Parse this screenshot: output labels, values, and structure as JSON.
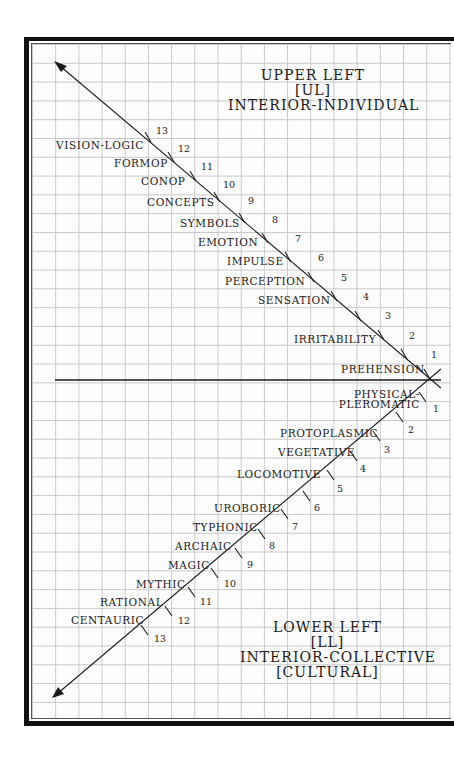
{
  "upper": {
    "title_lines": [
      "UPPER LEFT",
      "[UL]",
      "INTERIOR-INDIVIDUAL"
    ],
    "levels": [
      {
        "n": "1",
        "label": "PREHENSION"
      },
      {
        "n": "2",
        "label": ""
      },
      {
        "n": "3",
        "label": "IRRITABILITY"
      },
      {
        "n": "4",
        "label": "SENSATION"
      },
      {
        "n": "5",
        "label": "PERCEPTION"
      },
      {
        "n": "6",
        "label": "IMPULSE"
      },
      {
        "n": "7",
        "label": "EMOTION"
      },
      {
        "n": "8",
        "label": "SYMBOLS"
      },
      {
        "n": "9",
        "label": "CONCEPTS"
      },
      {
        "n": "10",
        "label": "CONOP"
      },
      {
        "n": "11",
        "label": "FORMOP"
      },
      {
        "n": "12",
        "label": "VISION-LOGIC"
      },
      {
        "n": "13",
        "label": ""
      }
    ]
  },
  "lower": {
    "title_lines": [
      "LOWER LEFT",
      "[LL]",
      "INTERIOR-COLLECTIVE",
      "[CULTURAL]"
    ],
    "levels": [
      {
        "n": "1",
        "label_lines": [
          "PHYSICAL-",
          "PLEROMATIC"
        ]
      },
      {
        "n": "2",
        "label": "PROTOPLASMIC"
      },
      {
        "n": "3",
        "label": "VEGETATIVE"
      },
      {
        "n": "4",
        "label": "LOCOMOTIVE"
      },
      {
        "n": "5",
        "label": ""
      },
      {
        "n": "6",
        "label": "UROBORIC"
      },
      {
        "n": "7",
        "label": "TYPHONIC"
      },
      {
        "n": "8",
        "label": "ARCHAIC"
      },
      {
        "n": "9",
        "label": "MAGIC"
      },
      {
        "n": "10",
        "label": "MYTHIC"
      },
      {
        "n": "11",
        "label": "RATIONAL"
      },
      {
        "n": "12",
        "label": "CENTAURIC"
      },
      {
        "n": "13",
        "label": ""
      }
    ]
  },
  "colors": {
    "ink": "#1a1a1a",
    "grid": "#c8c8c8",
    "frame": "#111111",
    "paper": "#fdfdfd"
  }
}
